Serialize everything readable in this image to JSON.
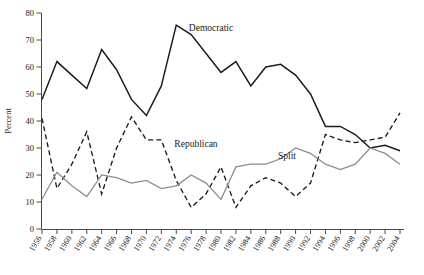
{
  "chart_data": {
    "type": "line",
    "title": "",
    "xlabel": "",
    "ylabel": "Percent",
    "ylim": [
      0,
      80
    ],
    "ytick_step": 10,
    "grid": false,
    "legend_position": "inline-annotations",
    "x": [
      1956,
      1958,
      1960,
      1962,
      1964,
      1966,
      1968,
      1970,
      1972,
      1974,
      1976,
      1978,
      1980,
      1982,
      1984,
      1986,
      1988,
      1990,
      1992,
      1994,
      1996,
      1998,
      2000,
      2002,
      2004
    ],
    "categories": [
      "1956",
      "1958",
      "1960",
      "1962",
      "1964",
      "1966",
      "1968",
      "1970",
      "1972",
      "1974",
      "1976",
      "1978",
      "1980",
      "1982",
      "1984",
      "1986",
      "1988",
      "1990",
      "1992",
      "1994",
      "1996",
      "1998",
      "2000",
      "2002",
      "2004"
    ],
    "yticks": [
      0,
      10,
      20,
      30,
      40,
      50,
      60,
      70,
      80
    ],
    "series": [
      {
        "name": "Democratic",
        "style": "solid",
        "color": "#1a1a1a",
        "values": [
          48,
          62,
          57,
          52,
          66.5,
          59,
          48,
          42,
          53,
          75.5,
          72,
          65,
          58,
          62,
          53,
          60,
          61,
          57,
          50,
          38,
          38,
          35,
          30,
          31,
          29
        ]
      },
      {
        "name": "Republican",
        "style": "dashed",
        "color": "#1a1a1a",
        "values": [
          41,
          15,
          24,
          36,
          13,
          30,
          41.5,
          33,
          33,
          18,
          8,
          13,
          23,
          8,
          16,
          19,
          17,
          12,
          17,
          35,
          33,
          32,
          33,
          34,
          43
        ]
      },
      {
        "name": "Split",
        "style": "solid",
        "color": "#8c8c8c",
        "values": [
          11,
          21,
          16,
          12,
          20,
          19,
          17,
          18,
          15,
          16,
          20,
          17,
          11,
          23,
          24,
          24,
          26,
          30,
          28,
          24,
          22,
          24,
          30,
          28,
          24
        ]
      }
    ],
    "annotations": [
      {
        "label": "Democratic",
        "x_px": 211,
        "y_px": 31
      },
      {
        "label": "Republican",
        "x_px": 196,
        "y_px": 147
      },
      {
        "label": "Split",
        "x_px": 287,
        "y_px": 159
      }
    ]
  },
  "axes": {
    "y_axis_title": "Percent"
  }
}
